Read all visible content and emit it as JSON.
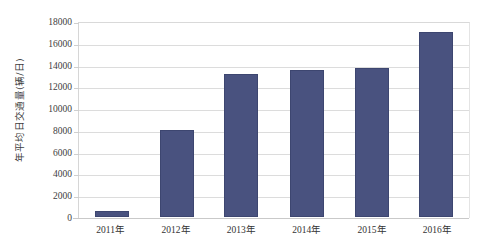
{
  "chart_data": {
    "type": "bar",
    "title": "",
    "subtitle": "",
    "xlabel": "",
    "ylabel": "年平均日交通量(辆/日)",
    "categories": [
      "2011年",
      "2012年",
      "2013年",
      "2014年",
      "2015年",
      "2016年"
    ],
    "values": [
      600,
      8050,
      13200,
      13600,
      13800,
      17100
    ],
    "series": [
      {
        "name": "年平均日交通量",
        "values": [
          600,
          8050,
          13200,
          13600,
          13800,
          17100
        ]
      }
    ],
    "ylim": [
      0,
      18000
    ],
    "ytick_step": 2000,
    "ytick_labels": [
      "18000",
      "16000",
      "14000",
      "12000",
      "10000",
      "8000",
      "6000",
      "4000",
      "2000",
      "0"
    ],
    "ytick_values": [
      18000,
      16000,
      14000,
      12000,
      10000,
      8000,
      6000,
      4000,
      2000,
      0
    ],
    "grid": true,
    "grid_axis": "y",
    "legend": false,
    "legend_position": "none",
    "bar_color": "#49527f",
    "grid_color": "#dcdcdc",
    "background_color": "#ffffff",
    "text_color": "#3a3a3a"
  }
}
